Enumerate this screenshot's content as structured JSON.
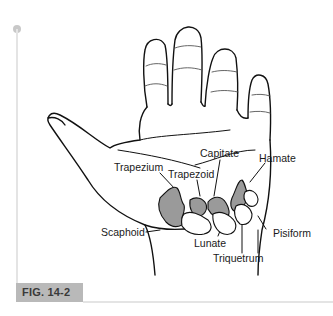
{
  "figure": {
    "caption": "FIG. 14-2",
    "colors": {
      "bone_fill": "#9a9a9a",
      "outline": "#111111",
      "caption_bg": "#b9b9b9",
      "frame_line": "#e4e4e4"
    }
  },
  "labels": {
    "capitate": "Capitate",
    "hamate": "Hamate",
    "trapezium": "Trapezium",
    "trapezoid": "Trapezoid",
    "scaphoid": "Scaphoid",
    "lunate": "Lunate",
    "pisiform": "Pisiform",
    "triquetrum": "Triquetrum"
  }
}
